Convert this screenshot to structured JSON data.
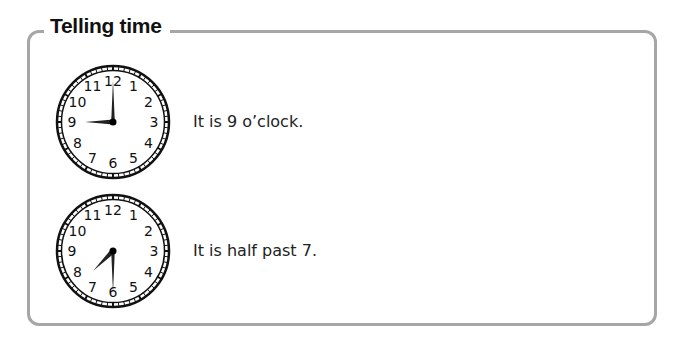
{
  "section": {
    "title": "Telling time",
    "border_color": "#a6a6a6"
  },
  "examples": [
    {
      "clock": {
        "hour_hand_angle": 270,
        "minute_hand_angle": 0,
        "numbers": [
          "12",
          "1",
          "2",
          "3",
          "4",
          "5",
          "6",
          "7",
          "8",
          "9",
          "10",
          "11"
        ]
      },
      "caption": "It is 9 o’clock."
    },
    {
      "clock": {
        "hour_hand_angle": 225,
        "minute_hand_angle": 180,
        "numbers": [
          "12",
          "1",
          "2",
          "3",
          "4",
          "5",
          "6",
          "7",
          "8",
          "9",
          "10",
          "11"
        ]
      },
      "caption": "It is half past 7."
    }
  ]
}
